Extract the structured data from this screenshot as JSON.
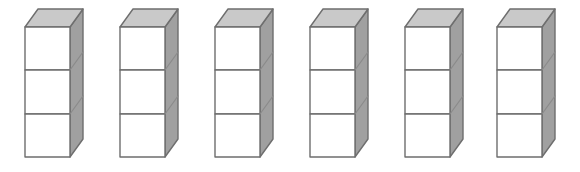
{
  "scene": {
    "title": "Row of six three-cube towers",
    "background_color": "#ffffff",
    "width": 580,
    "height": 172,
    "tower_count": 6,
    "cubes_per_tower": 3,
    "total_cubes": 18,
    "projection": "oblique (cabinet) 3D",
    "labels": {
      "tower_1": "Tower 1",
      "tower_2": "Tower 2",
      "tower_3": "Tower 3",
      "tower_4": "Tower 4",
      "tower_5": "Tower 5",
      "tower_6": "Tower 6"
    }
  },
  "colors": {
    "front_face": "#ffffff",
    "top_face": "#c9c9c9",
    "side_face": "#a0a0a0",
    "edge_stroke": "#6e6e6e",
    "inner_edge_stroke": "#8a8a8a",
    "background": "#ffffff"
  },
  "geometry": {
    "front_face_width": 45,
    "cube_front_height": 43,
    "depth_offset_x": 13,
    "depth_offset_y": 18,
    "front_top_y": 27,
    "front_bottom_y": 157,
    "divider_y_1": 70,
    "divider_y_2": 114
  },
  "towers": [
    {
      "name": "Tower 1",
      "left": 18,
      "cubes": 3
    },
    {
      "name": "Tower 2",
      "left": 113,
      "cubes": 3
    },
    {
      "name": "Tower 3",
      "left": 208,
      "cubes": 3
    },
    {
      "name": "Tower 4",
      "left": 303,
      "cubes": 3
    },
    {
      "name": "Tower 5",
      "left": 398,
      "cubes": 3
    },
    {
      "name": "Tower 6",
      "left": 490,
      "cubes": 3
    }
  ]
}
